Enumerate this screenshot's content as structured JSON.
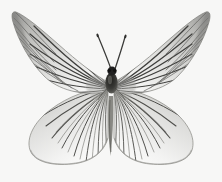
{
  "image": {
    "subject": "butterfly-specimen",
    "view": "dorsal-spread-mounted",
    "width": 222,
    "height": 182,
    "background_color": "#f7f7f6",
    "rendering": "grayscale-photograph",
    "caption": "Grayscale dorsal view of a spread-mounted white butterfly with dark radiating wing veins"
  },
  "palette": {
    "background": "#f7f7f6",
    "wing_membrane_light": "#fbfbfa",
    "wing_membrane_mid": "#e3e3e1",
    "wing_shade": "#c9c9c6",
    "wing_apex_dark": "#8f8f8d",
    "vein_dark": "#4a4a48",
    "vein_mid": "#6e6e6b",
    "vein_light": "#9a9a97",
    "body_dark": "#2b2b29",
    "body_mid": "#55554f",
    "antenna": "#3a3a38",
    "outline": "#7c7c79"
  },
  "anatomy": {
    "parts": [
      {
        "id": "left-forewing",
        "label": "Left forewing",
        "tip_x": 14,
        "tip_y": 11
      },
      {
        "id": "right-forewing",
        "label": "Right forewing",
        "tip_x": 208,
        "tip_y": 11
      },
      {
        "id": "left-hindwing",
        "label": "Left hindwing",
        "tip_x": 28,
        "tip_y": 120
      },
      {
        "id": "right-hindwing",
        "label": "Right hindwing",
        "tip_x": 194,
        "tip_y": 120
      },
      {
        "id": "thorax",
        "label": "Thorax",
        "tip_x": 111,
        "tip_y": 78
      },
      {
        "id": "head",
        "label": "Head",
        "tip_x": 112,
        "tip_y": 70
      },
      {
        "id": "abdomen",
        "label": "Abdomen",
        "tip_x": 111,
        "tip_y": 140
      },
      {
        "id": "left-antenna",
        "label": "Left antenna",
        "tip_x": 98,
        "tip_y": 35
      },
      {
        "id": "right-antenna",
        "label": "Right antenna",
        "tip_x": 125,
        "tip_y": 37
      }
    ],
    "wingspan_px": 196,
    "body_length_px": 92,
    "symmetry_axis_x": 111
  },
  "veins": {
    "forewing_count": 11,
    "hindwing_count": 13,
    "description": "Dark veins radiating from wing base toward outer margin"
  }
}
